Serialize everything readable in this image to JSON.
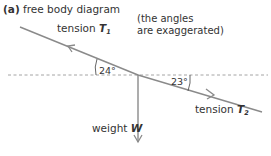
{
  "title": {
    "tag": "(a)",
    "text": "free body diagram"
  },
  "note": {
    "line1": "(the angles",
    "line2": "are exaggerated)"
  },
  "forces": {
    "tension1": {
      "prefix": "tension ",
      "symbol": "T",
      "subscript": "1"
    },
    "tension2": {
      "prefix": "tension ",
      "symbol": "T",
      "subscript": "2"
    },
    "weight": {
      "prefix": "weight ",
      "symbol": "W"
    }
  },
  "angles": {
    "left": "24°",
    "right": "23°"
  },
  "colors": {
    "line": "#888888",
    "dash": "#999999",
    "text": "#333333"
  }
}
